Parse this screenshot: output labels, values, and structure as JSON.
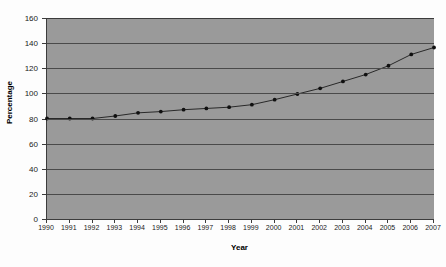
{
  "chart_data": {
    "type": "line",
    "title": "",
    "xlabel": "Year",
    "ylabel": "Percentage",
    "categories": [
      "1990",
      "1991",
      "1992",
      "1993",
      "1994",
      "1995",
      "1996",
      "1997",
      "1998",
      "1999",
      "2000",
      "2001",
      "2002",
      "2003",
      "2004",
      "2005",
      "2006",
      "2007"
    ],
    "x": [
      1990,
      1991,
      1992,
      1993,
      1994,
      1995,
      1996,
      1997,
      1998,
      1999,
      2000,
      2001,
      2002,
      2003,
      2004,
      2005,
      2006,
      2007
    ],
    "values": [
      80,
      80,
      80,
      82,
      84.5,
      85.5,
      87,
      88,
      89,
      91,
      95,
      99.5,
      104,
      109.5,
      115,
      122,
      131,
      136.5
    ],
    "series": [
      {
        "name": "Percentage",
        "values": [
          80,
          80,
          80,
          82,
          84.5,
          85.5,
          87,
          88,
          89,
          91,
          95,
          99.5,
          104,
          109.5,
          115,
          122,
          131,
          136.5
        ]
      }
    ],
    "ylim": [
      0,
      160
    ],
    "yticks": [
      0,
      20,
      40,
      60,
      80,
      100,
      120,
      140,
      160
    ],
    "ytick_labels": [
      "0",
      "20",
      "40",
      "60",
      "80",
      "100",
      "120",
      "140",
      "160"
    ],
    "xlim": [
      1990,
      2007
    ],
    "grid": "horizontal",
    "legend": "none",
    "marker": "filled-circle",
    "line_color": "#1c1c1c",
    "marker_color": "#101010",
    "plot_background": "#9a9a9a",
    "gridline_color": "#4a4a4a",
    "axis_color": "#3c3c3c",
    "page_background": "#fdfdfd"
  }
}
